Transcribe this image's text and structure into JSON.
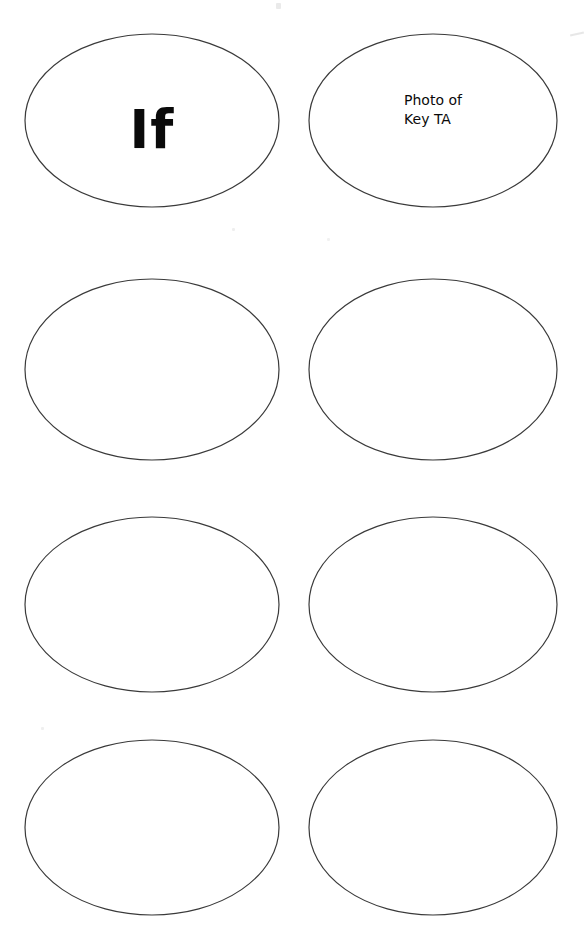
{
  "page": {
    "background_color": "#ffffff",
    "width": 588,
    "height": 937,
    "outline_color": "#3a3a3a",
    "text_color": "#0a0a0a"
  },
  "grid": {
    "columns": 2,
    "rows": 4,
    "total_ovals": 8
  },
  "ovals": [
    {
      "id": "oval-1",
      "row": 1,
      "column": 1,
      "x": 24,
      "y": 33,
      "width": 256,
      "height": 175,
      "label": "If",
      "label_style": "big",
      "label_top": 70,
      "filled": true
    },
    {
      "id": "oval-2",
      "row": 1,
      "column": 2,
      "x": 308,
      "y": 33,
      "width": 250,
      "height": 175,
      "label": "Photo of\nKey TA",
      "label_style": "small",
      "label_top": 58,
      "filled": true
    },
    {
      "id": "oval-3",
      "row": 2,
      "column": 1,
      "x": 24,
      "y": 278,
      "width": 256,
      "height": 183,
      "label": "",
      "label_style": "small",
      "label_top": 70,
      "filled": false
    },
    {
      "id": "oval-4",
      "row": 2,
      "column": 2,
      "x": 308,
      "y": 278,
      "width": 250,
      "height": 183,
      "label": "",
      "label_style": "small",
      "label_top": 70,
      "filled": false
    },
    {
      "id": "oval-5",
      "row": 3,
      "column": 1,
      "x": 24,
      "y": 516,
      "width": 256,
      "height": 177,
      "label": "",
      "label_style": "small",
      "label_top": 70,
      "filled": false
    },
    {
      "id": "oval-6",
      "row": 3,
      "column": 2,
      "x": 308,
      "y": 516,
      "width": 250,
      "height": 177,
      "label": "",
      "label_style": "small",
      "label_top": 70,
      "filled": false
    },
    {
      "id": "oval-7",
      "row": 4,
      "column": 1,
      "x": 24,
      "y": 739,
      "width": 256,
      "height": 177,
      "label": "",
      "label_style": "small",
      "label_top": 70,
      "filled": false
    },
    {
      "id": "oval-8",
      "row": 4,
      "column": 2,
      "x": 308,
      "y": 739,
      "width": 250,
      "height": 177,
      "label": "",
      "label_style": "small",
      "label_top": 70,
      "filled": false
    }
  ]
}
